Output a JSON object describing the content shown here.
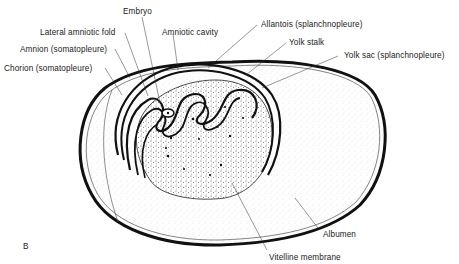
{
  "figure": {
    "panel_letter": "B",
    "labels": {
      "embryo": "Embryo",
      "lateral_amniotic_fold": "Lateral amniotic fold",
      "amniotic_cavity": "Amniotic cavity",
      "amnion": "Amnion (somatopleure)",
      "chorion": "Chorion (somatopleure)",
      "allantois": "Allantois (splanchnopleure)",
      "yolk_stalk": "Yolk stalk",
      "yolk_sac": "Yolk sac (splanchnopleure)",
      "albumen": "Albumen",
      "vitelline_membrane": "Vitelline membrane"
    }
  }
}
